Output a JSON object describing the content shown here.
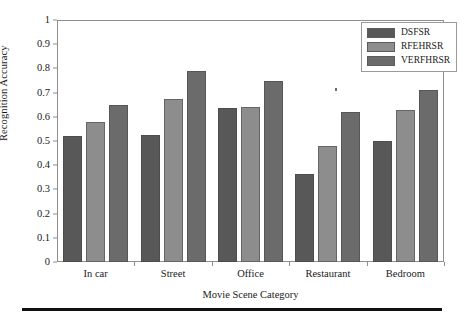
{
  "chart_data": {
    "type": "bar",
    "title": "",
    "xlabel": "Movie Scene Category",
    "ylabel": "Recognition Accuracy",
    "categories": [
      "In car",
      "Street",
      "Office",
      "Restaurant",
      "Bedroom"
    ],
    "series": [
      {
        "name": "DSFSR",
        "color": "#585858",
        "values": [
          0.52,
          0.525,
          0.635,
          0.365,
          0.5
        ]
      },
      {
        "name": "RFEHRSR",
        "color": "#8d8d8d",
        "values": [
          0.58,
          0.675,
          0.64,
          0.48,
          0.63
        ]
      },
      {
        "name": "VERFHRSR",
        "color": "#6b6b6b",
        "values": [
          0.65,
          0.79,
          0.75,
          0.62,
          0.71
        ]
      }
    ],
    "ylim": [
      0,
      1
    ],
    "yticks": [
      "0",
      "0.1",
      "0.2",
      "0.3",
      "0.4",
      "0.5",
      "0.6",
      "0.7",
      "0.8",
      "0.9",
      "1"
    ],
    "grid": false,
    "legend_position": "top-right"
  },
  "figure": {
    "axis_color": "#8e8e8e",
    "background": "#ffffff",
    "rule_color": "#111111"
  }
}
